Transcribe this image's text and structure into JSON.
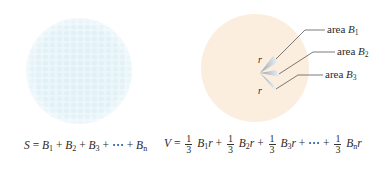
{
  "left_figure": {
    "description": "sphere subdivided into many small patches",
    "color": "#e9f6fa",
    "formula": {
      "lhs": "S",
      "terms": [
        {
          "base": "B",
          "sub": "1"
        },
        {
          "base": "B",
          "sub": "2"
        },
        {
          "base": "B",
          "sub": "3"
        },
        {
          "base": "⋯",
          "sub": ""
        },
        {
          "base": "B",
          "sub": "n"
        }
      ],
      "equals": "=",
      "plus": "+"
    }
  },
  "right_figure": {
    "description": "sphere with cones from center to surface patches",
    "color": "#fbeedf",
    "radius_label": "r",
    "area_labels": [
      {
        "text": "area",
        "var": "B",
        "sub": "1"
      },
      {
        "text": "area",
        "var": "B",
        "sub": "2"
      },
      {
        "text": "area",
        "var": "B",
        "sub": "3"
      }
    ],
    "formula": {
      "lhs": "V",
      "equals": "=",
      "plus": "+",
      "frac_num": "1",
      "frac_den": "3",
      "ellipsis": "⋯",
      "radius": "r",
      "subs": [
        "1",
        "2",
        "3",
        "n"
      ],
      "base": "B"
    }
  }
}
